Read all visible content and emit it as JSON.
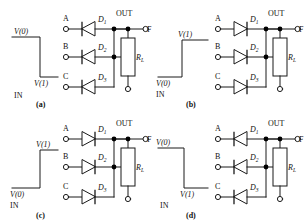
{
  "figure": {
    "type": "circuit-diagram",
    "panels": [
      {
        "id": "a",
        "caption": "(a)",
        "input_label": "IN",
        "waveform": {
          "shape": "falling-edge",
          "start_level_label": "V(0)",
          "end_level_label": "V(1)",
          "start_level_position": "top",
          "end_level_position": "bottom"
        },
        "inputs": [
          "A",
          "B",
          "C"
        ],
        "diodes": [
          {
            "label": "D",
            "subscript": "1",
            "direction": "left"
          },
          {
            "label": "D",
            "subscript": "2",
            "direction": "left"
          },
          {
            "label": "D",
            "subscript": "3",
            "direction": "left"
          }
        ],
        "output_label": "OUT",
        "output_terminal": "F",
        "resistor": {
          "label": "R",
          "subscript": "L"
        }
      },
      {
        "id": "b",
        "caption": "(b)",
        "input_label": "IN",
        "waveform": {
          "shape": "rising-edge",
          "start_level_label": "V(0)",
          "end_level_label": "V(1)",
          "start_level_position": "bottom",
          "end_level_position": "top"
        },
        "inputs": [
          "A",
          "B",
          "C"
        ],
        "diodes": [
          {
            "label": "D",
            "subscript": "1",
            "direction": "right"
          },
          {
            "label": "D",
            "subscript": "2",
            "direction": "right"
          },
          {
            "label": "D",
            "subscript": "3",
            "direction": "right"
          }
        ],
        "output_label": "OUT",
        "output_terminal": "F",
        "resistor": {
          "label": "R",
          "subscript": "L"
        }
      },
      {
        "id": "c",
        "caption": "(c)",
        "input_label": "IN",
        "waveform": {
          "shape": "rising-edge",
          "start_level_label": "V(0)",
          "end_level_label": "V(1)",
          "start_level_position": "bottom",
          "end_level_position": "top"
        },
        "inputs": [
          "A",
          "B",
          "C"
        ],
        "diodes": [
          {
            "label": "D",
            "subscript": "1",
            "direction": "right"
          },
          {
            "label": "D",
            "subscript": "2",
            "direction": "right"
          },
          {
            "label": "D",
            "subscript": "3",
            "direction": "right"
          }
        ],
        "output_label": "OUT",
        "output_terminal": "F",
        "resistor": {
          "label": "R",
          "subscript": "L"
        }
      },
      {
        "id": "d",
        "caption": "(d)",
        "input_label": "IN",
        "waveform": {
          "shape": "falling-edge",
          "start_level_label": "V(0)",
          "end_level_label": "V(1)",
          "start_level_position": "top",
          "end_level_position": "bottom"
        },
        "inputs": [
          "A",
          "B",
          "C"
        ],
        "diodes": [
          {
            "label": "D",
            "subscript": "1",
            "direction": "left"
          },
          {
            "label": "D",
            "subscript": "2",
            "direction": "left"
          },
          {
            "label": "D",
            "subscript": "3",
            "direction": "left"
          }
        ],
        "output_label": "OUT",
        "output_terminal": "F",
        "resistor": {
          "label": "R",
          "subscript": "L"
        }
      }
    ],
    "colors": {
      "line": "#1a1a1a",
      "background": "#ffffff",
      "node": "#000000"
    }
  }
}
